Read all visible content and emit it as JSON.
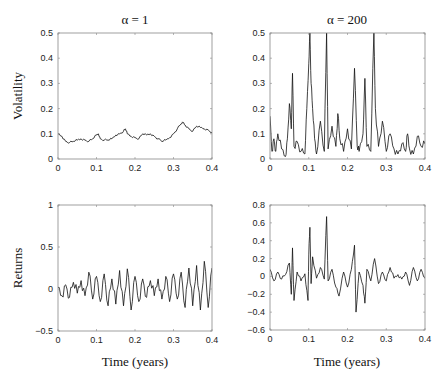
{
  "figure": {
    "col_titles": [
      "α = 1",
      "α = 200"
    ],
    "row_labels": [
      "Volatility",
      "Returns"
    ],
    "xlabel": "Time (years)"
  },
  "chart_data": [
    {
      "type": "line",
      "title": "α = 1",
      "ylabel": "Volatility",
      "xlabel": "",
      "xlim": [
        0,
        0.4
      ],
      "ylim": [
        0,
        0.5
      ],
      "xticks": [
        "0",
        "0.1",
        "0.2",
        "0.3",
        "0.4"
      ],
      "yticks": [
        "0",
        "0.1",
        "0.2",
        "0.3",
        "0.4",
        "0.5"
      ],
      "grid": false,
      "x": [
        0,
        0.01,
        0.02,
        0.03,
        0.04,
        0.05,
        0.06,
        0.07,
        0.08,
        0.09,
        0.1,
        0.105,
        0.11,
        0.12,
        0.13,
        0.14,
        0.15,
        0.16,
        0.17,
        0.175,
        0.18,
        0.19,
        0.2,
        0.21,
        0.22,
        0.23,
        0.24,
        0.25,
        0.26,
        0.27,
        0.28,
        0.29,
        0.3,
        0.31,
        0.32,
        0.325,
        0.33,
        0.34,
        0.35,
        0.36,
        0.37,
        0.38,
        0.39,
        0.4
      ],
      "values": [
        0.1,
        0.09,
        0.07,
        0.065,
        0.07,
        0.075,
        0.08,
        0.075,
        0.07,
        0.08,
        0.095,
        0.1,
        0.08,
        0.075,
        0.075,
        0.08,
        0.095,
        0.1,
        0.11,
        0.12,
        0.1,
        0.09,
        0.085,
        0.08,
        0.1,
        0.095,
        0.1,
        0.09,
        0.08,
        0.07,
        0.075,
        0.085,
        0.1,
        0.12,
        0.14,
        0.145,
        0.135,
        0.12,
        0.11,
        0.13,
        0.125,
        0.12,
        0.115,
        0.105
      ]
    },
    {
      "type": "line",
      "title": "α = 200",
      "ylabel": "",
      "xlabel": "",
      "xlim": [
        0,
        0.4
      ],
      "ylim": [
        0,
        0.5
      ],
      "xticks": [
        "0",
        "0.1",
        "0.2",
        "0.3",
        "0.4"
      ],
      "yticks": [
        "0",
        "0.1",
        "0.2",
        "0.3",
        "0.4",
        "0.5"
      ],
      "grid": false,
      "x": [
        0,
        0.005,
        0.01,
        0.015,
        0.02,
        0.03,
        0.04,
        0.045,
        0.05,
        0.055,
        0.058,
        0.062,
        0.07,
        0.08,
        0.09,
        0.095,
        0.1,
        0.103,
        0.106,
        0.11,
        0.115,
        0.12,
        0.13,
        0.14,
        0.146,
        0.15,
        0.16,
        0.17,
        0.175,
        0.18,
        0.19,
        0.2,
        0.21,
        0.218,
        0.225,
        0.23,
        0.24,
        0.245,
        0.25,
        0.26,
        0.268,
        0.272,
        0.28,
        0.29,
        0.3,
        0.31,
        0.32,
        0.33,
        0.34,
        0.35,
        0.355,
        0.36,
        0.37,
        0.38,
        0.39,
        0.4
      ],
      "values": [
        0.17,
        0.03,
        0.08,
        0.03,
        0.1,
        0.04,
        0.01,
        0.08,
        0.22,
        0.12,
        0.34,
        0.05,
        0.07,
        0.03,
        0.02,
        0.2,
        0.38,
        0.5,
        0.3,
        0.2,
        0.08,
        0.02,
        0.15,
        0.03,
        0.5,
        0.04,
        0.13,
        0.05,
        0.18,
        0.08,
        0.03,
        0.12,
        0.04,
        0.36,
        0.05,
        0.03,
        0.1,
        0.32,
        0.05,
        0.03,
        0.5,
        0.2,
        0.05,
        0.15,
        0.03,
        0.1,
        0.04,
        0.02,
        0.06,
        0.03,
        0.1,
        0.04,
        0.02,
        0.09,
        0.05,
        0.06
      ]
    },
    {
      "type": "line",
      "title": "",
      "ylabel": "Returns",
      "xlabel": "Time (years)",
      "xlim": [
        0,
        0.4
      ],
      "ylim": [
        -0.5,
        1
      ],
      "xticks": [
        "0",
        "0.1",
        "0.2",
        "0.3",
        "0.4"
      ],
      "yticks": [
        "-0.5",
        "0",
        "0.5",
        "1"
      ],
      "grid": false,
      "x": [
        0,
        0.01,
        0.02,
        0.03,
        0.04,
        0.05,
        0.06,
        0.07,
        0.08,
        0.09,
        0.1,
        0.11,
        0.12,
        0.13,
        0.14,
        0.15,
        0.16,
        0.17,
        0.18,
        0.19,
        0.2,
        0.21,
        0.22,
        0.23,
        0.24,
        0.25,
        0.26,
        0.27,
        0.28,
        0.29,
        0.3,
        0.31,
        0.32,
        0.33,
        0.34,
        0.35,
        0.36,
        0.37,
        0.38,
        0.39,
        0.4
      ],
      "values": [
        0.02,
        -0.08,
        0.05,
        -0.1,
        0.08,
        -0.05,
        0.1,
        -0.08,
        0.2,
        -0.12,
        0.15,
        -0.15,
        0.18,
        -0.2,
        0.12,
        -0.18,
        0.22,
        -0.2,
        0.24,
        -0.25,
        0.15,
        -0.15,
        0.12,
        -0.1,
        0.1,
        -0.08,
        0.12,
        -0.12,
        0.15,
        -0.15,
        0.18,
        -0.12,
        0.2,
        -0.22,
        0.25,
        -0.2,
        0.28,
        -0.25,
        0.33,
        -0.22,
        0.25
      ]
    },
    {
      "type": "line",
      "title": "",
      "ylabel": "",
      "xlabel": "Time (years)",
      "xlim": [
        0,
        0.4
      ],
      "ylim": [
        -0.6,
        0.8
      ],
      "xticks": [
        "0",
        "0.1",
        "0.2",
        "0.3",
        "0.4"
      ],
      "yticks": [
        "-0.6",
        "-0.4",
        "-0.2",
        "0",
        "0.2",
        "0.4",
        "0.6",
        "0.8"
      ],
      "grid": false,
      "x": [
        0,
        0.01,
        0.02,
        0.03,
        0.04,
        0.05,
        0.055,
        0.058,
        0.062,
        0.07,
        0.08,
        0.09,
        0.098,
        0.1,
        0.103,
        0.106,
        0.11,
        0.12,
        0.13,
        0.14,
        0.146,
        0.15,
        0.16,
        0.17,
        0.178,
        0.19,
        0.2,
        0.21,
        0.218,
        0.222,
        0.23,
        0.24,
        0.245,
        0.25,
        0.26,
        0.27,
        0.28,
        0.29,
        0.3,
        0.31,
        0.32,
        0.33,
        0.34,
        0.35,
        0.36,
        0.37,
        0.38,
        0.39,
        0.4
      ],
      "values": [
        0.08,
        -0.05,
        0.05,
        -0.03,
        0.02,
        0.15,
        -0.2,
        0.32,
        -0.27,
        0.05,
        -0.05,
        0.03,
        -0.27,
        0.25,
        0.55,
        -0.08,
        0.22,
        -0.02,
        0.1,
        -0.03,
        0.67,
        -0.05,
        0.08,
        -0.12,
        -0.22,
        0.05,
        -0.12,
        0.08,
        0.35,
        -0.4,
        0.05,
        -0.1,
        -0.3,
        0.08,
        -0.05,
        0.2,
        -0.08,
        0.05,
        -0.05,
        0.1,
        -0.02,
        0.02,
        -0.03,
        0.05,
        -0.1,
        0.1,
        -0.05,
        0.08,
        -0.02
      ]
    }
  ]
}
